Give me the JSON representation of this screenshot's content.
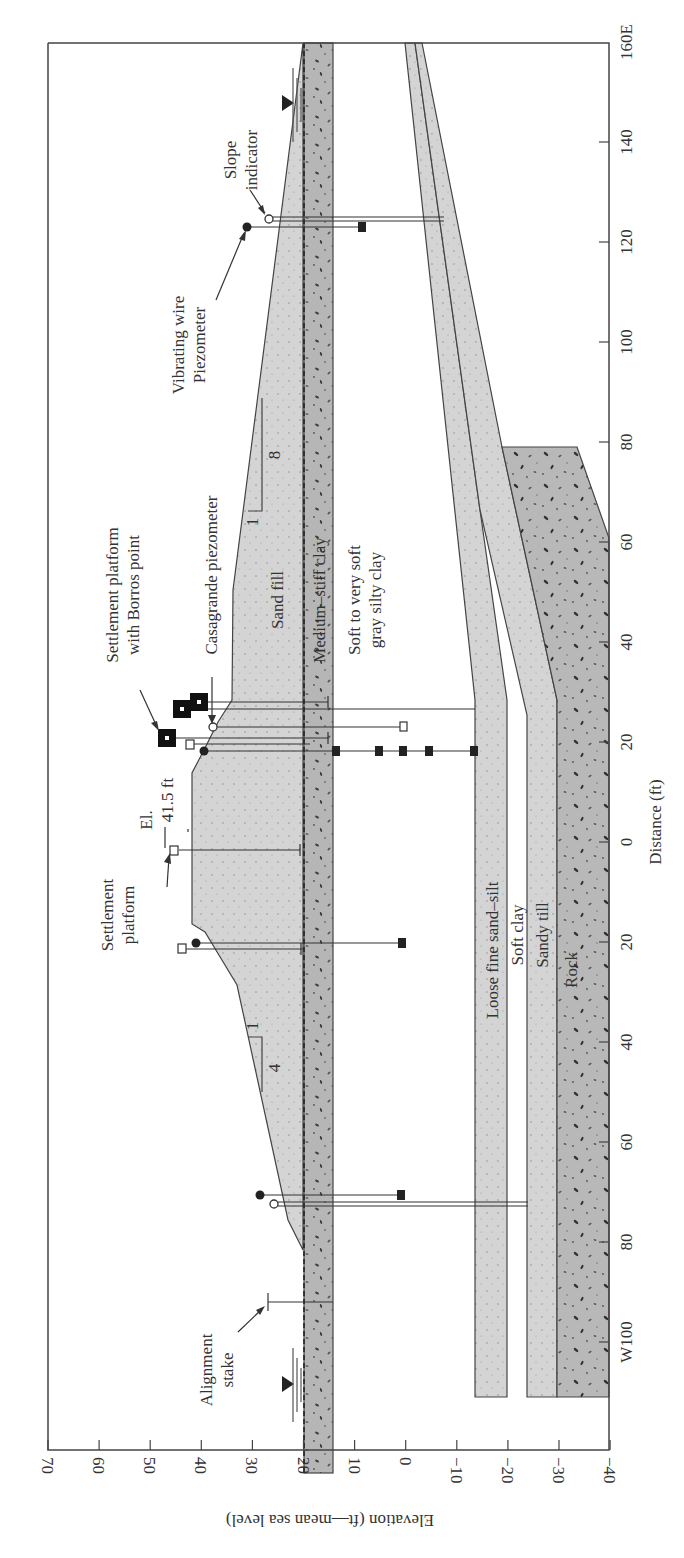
{
  "figure": {
    "orientation": "rotated-90-ccw",
    "colors": {
      "sand_fill": "#d4d4d4",
      "medium_stiff_clay": "#b4b4b4",
      "loose_fine_sand_silt": "#d2d2d2",
      "sandy_till": "#d6d6d6",
      "rock": "#b8b8b8",
      "line": "#444444",
      "text": "#333333"
    }
  },
  "axes": {
    "elevation": {
      "title": "Elevation (ft—mean sea level)",
      "ticks": [
        "70",
        "60",
        "50",
        "40",
        "30",
        "20",
        "10",
        "0",
        "−10",
        "−20",
        "−30",
        "−40"
      ],
      "values": [
        70,
        60,
        50,
        40,
        30,
        20,
        10,
        0,
        -10,
        -20,
        -30,
        -40
      ]
    },
    "distance": {
      "title": "Distance (ft)",
      "ticks": [
        "160E",
        "140",
        "120",
        "100",
        "80",
        "60",
        "40",
        "20",
        "0",
        "20",
        "40",
        "60",
        "80",
        "W100"
      ],
      "values": [
        160,
        140,
        120,
        100,
        80,
        60,
        40,
        20,
        0,
        -20,
        -40,
        -60,
        -80,
        -100
      ]
    }
  },
  "layers": {
    "sand_fill": "Sand fill",
    "medium_stiff_clay": "Medium–stiff clay",
    "soft_clay_line1": "Soft to very soft",
    "soft_clay_line2": "gray silty clay",
    "loose_sand_silt": "Loose fine sand–silt",
    "soft_clay": "Soft clay",
    "sandy_till": "Sandy till",
    "rock": "Rock"
  },
  "annotations": {
    "slope_indicator_1": "Slope",
    "slope_indicator_2": "indicator",
    "vibrating_wire_1": "Vibrating wire",
    "vibrating_wire_2": "Piezometer",
    "settlement_borros_1": "Settlement platform",
    "settlement_borros_2": "with Borros point",
    "casagrande": "Casagrande piezometer",
    "crest_el_1": "El.",
    "crest_el_2": "41.5 ft",
    "settlement_platform_1": "Settlement",
    "settlement_platform_2": "platform",
    "alignment_stake_1": "Alignment",
    "alignment_stake_2": "stake",
    "slope_east_v": "1",
    "slope_east_h": "8",
    "slope_west_v": "1",
    "slope_west_h": "4"
  },
  "chart_data": {
    "type": "cross-section",
    "xlabel": "Distance (ft)",
    "ylabel": "Elevation (ft—mean sea level)",
    "xlim": [
      "W100",
      "160E"
    ],
    "ylim": [
      -40,
      70
    ],
    "crest_elevation_ft": 41.5,
    "slopes": {
      "east": "1:8",
      "west": "1:4"
    },
    "strata_top_elevations_at_W_end": {
      "sand_fill_embankment_base": 20,
      "medium_stiff_clay": [
        20,
        14
      ],
      "soft_to_very_soft_gray_silty_clay": [
        14,
        -15
      ],
      "loose_fine_sand_silt": [
        -15,
        -20
      ],
      "soft_clay": [
        -20,
        -24
      ],
      "sandy_till": [
        -24,
        -30
      ],
      "rock": [
        -30,
        -40
      ]
    },
    "instruments": [
      {
        "type": "Slope indicator",
        "distance": "124E"
      },
      {
        "type": "Vibrating wire piezometer",
        "distance": "123E"
      },
      {
        "type": "Settlement platform with Borros point",
        "distance": "20E–28E"
      },
      {
        "type": "Casagrande piezometer",
        "distance": "23E"
      },
      {
        "type": "Settlement platform",
        "distance": "0"
      },
      {
        "type": "Settlement platform",
        "distance": "21W"
      },
      {
        "type": "Vibrating wire piezometer",
        "distance": "20W"
      },
      {
        "type": "Vibrating wire piezometer",
        "distance": "70W"
      },
      {
        "type": "Slope indicator",
        "distance": "72W"
      },
      {
        "type": "Alignment stake",
        "distance": "92W"
      }
    ]
  }
}
